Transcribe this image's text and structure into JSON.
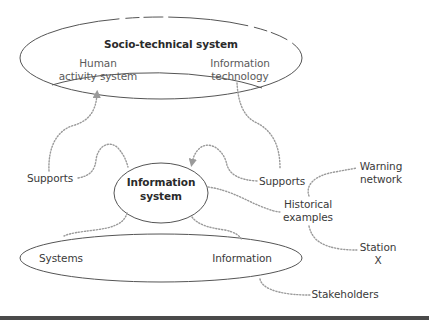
{
  "diagram": {
    "top_ellipse": {
      "title": "Socio-technical system",
      "left_label_line1": "Human",
      "left_label_line2": "activity system",
      "right_label_line1": "Information",
      "right_label_line2": "technology"
    },
    "center_ellipse": {
      "line1": "Information",
      "line2": "system"
    },
    "bottom_ellipse": {
      "left_label": "Systems",
      "right_label": "Information"
    },
    "connectors": {
      "supports_left": "Supports",
      "supports_right": "Supports",
      "historical_line1": "Historical",
      "historical_line2": "examples",
      "warning_line1": "Warning",
      "warning_line2": "network",
      "station_line1": "Station",
      "station_line2": "X",
      "stakeholders": "Stakeholders"
    },
    "colors": {
      "ellipse_stroke": "#555555",
      "dotted_stroke": "#9a9a9a",
      "text": "#3a3a3a",
      "bottom_bar": "#4a4a4a"
    }
  }
}
